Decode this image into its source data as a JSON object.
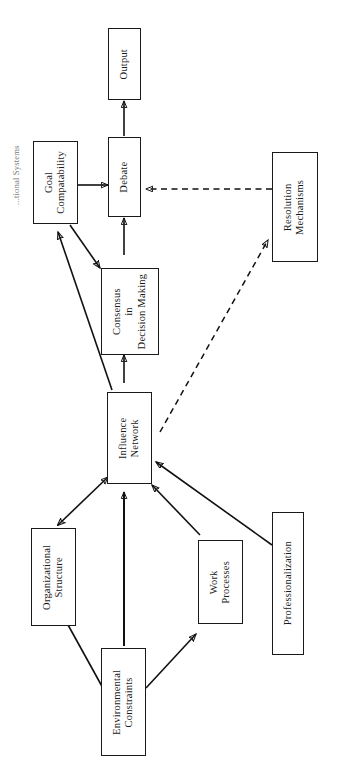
{
  "figure": {
    "caption_fragment": "...tional Systems",
    "orientation": "rotated-90-counterclockwise",
    "background_color": "#ffffff",
    "line_color": "#111111"
  },
  "diagram": {
    "type": "flow-diagram",
    "nodes": [
      {
        "id": "output",
        "label": "Output",
        "lines": [
          "Output"
        ]
      },
      {
        "id": "debate",
        "label": "Debate",
        "lines": [
          "Debate"
        ]
      },
      {
        "id": "goal",
        "label": "Goal Compatability",
        "lines": [
          "Goal",
          "Compatability"
        ]
      },
      {
        "id": "resolution",
        "label": "Resolution Mechanisms",
        "lines": [
          "Resolution",
          "Mechanisms"
        ]
      },
      {
        "id": "consensus",
        "label": "Consensus in Decision Making",
        "lines": [
          "Consensus",
          "in",
          "Decision Making"
        ]
      },
      {
        "id": "influence",
        "label": "Influence Network",
        "lines": [
          "Influence",
          "Network"
        ]
      },
      {
        "id": "orgstructure",
        "label": "Organizational Structure",
        "lines": [
          "Organizational",
          "Structure"
        ]
      },
      {
        "id": "workprocesses",
        "label": "Work Processes",
        "lines": [
          "Work",
          "Processes"
        ]
      },
      {
        "id": "professional",
        "label": "Professionalization",
        "lines": [
          "Professionalization"
        ]
      },
      {
        "id": "environmental",
        "label": "Environmental Constraints",
        "lines": [
          "Environmental",
          "Constraints"
        ]
      }
    ],
    "edges": [
      {
        "from": "debate",
        "to": "output",
        "style": "solid",
        "arrows": "single"
      },
      {
        "from": "goal",
        "to": "debate",
        "style": "solid",
        "arrows": "single"
      },
      {
        "from": "consensus",
        "to": "debate",
        "style": "solid",
        "arrows": "single"
      },
      {
        "from": "resolution",
        "to": "debate",
        "style": "dashed",
        "arrows": "single"
      },
      {
        "from": "goal",
        "to": "consensus",
        "style": "solid",
        "arrows": "single"
      },
      {
        "from": "influence",
        "to": "consensus",
        "style": "solid",
        "arrows": "single"
      },
      {
        "from": "influence",
        "to": "goal",
        "style": "solid",
        "arrows": "single"
      },
      {
        "from": "influence",
        "to": "resolution",
        "style": "dashed",
        "arrows": "single"
      },
      {
        "from": "orgstructure",
        "to": "influence",
        "style": "solid",
        "arrows": "double"
      },
      {
        "from": "workprocesses",
        "to": "influence",
        "style": "solid",
        "arrows": "single"
      },
      {
        "from": "professional",
        "to": "influence",
        "style": "solid",
        "arrows": "single"
      },
      {
        "from": "environmental",
        "to": "orgstructure",
        "style": "solid",
        "arrows": "single"
      },
      {
        "from": "environmental",
        "to": "workprocesses",
        "style": "solid",
        "arrows": "single"
      }
    ]
  }
}
